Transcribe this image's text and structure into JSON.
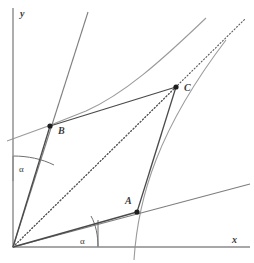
{
  "figure": {
    "background_color": "#ffffff",
    "width": 254,
    "height": 263
  },
  "axes": {
    "origin": {
      "x": 13,
      "y": 247,
      "label": "O"
    },
    "x_axis": {
      "label": "x",
      "label_x": 232,
      "label_y": 243,
      "from_x": 13,
      "from_y": 247,
      "to_x": 250,
      "to_y": 247,
      "color": "#8a8a8a"
    },
    "y_axis": {
      "label": "y",
      "label_x": 20,
      "label_y": 16,
      "from_x": 13,
      "from_y": 247,
      "to_x": 13,
      "to_y": 8,
      "color": "#8a8a8a"
    }
  },
  "points": [
    {
      "name": "A",
      "label": "A",
      "x": 137,
      "y": 212,
      "label_x": 125,
      "label_y": 204,
      "dot_radius": 2.6,
      "color": "#1e1e1e"
    },
    {
      "name": "B",
      "label": "B",
      "x": 50,
      "y": 126,
      "label_x": 58,
      "label_y": 133,
      "dot_radius": 2.6,
      "color": "#1e1e1e"
    },
    {
      "name": "C",
      "label": "C",
      "x": 176,
      "y": 87,
      "label_x": 184,
      "label_y": 91,
      "dot_radius": 2.6,
      "color": "#1e1e1e"
    }
  ],
  "segments": [
    {
      "name": "segment-origin-to-B",
      "from_x": 13,
      "from_y": 247,
      "to_x": 50,
      "to_y": 126,
      "color": "#4a4a4a",
      "style": "solid"
    },
    {
      "name": "segment-B-to-C",
      "from_x": 50,
      "from_y": 126,
      "to_x": 176,
      "to_y": 87,
      "color": "#4a4a4a",
      "style": "solid"
    },
    {
      "name": "segment-C-to-A",
      "from_x": 176,
      "from_y": 87,
      "to_x": 137,
      "to_y": 212,
      "color": "#4a4a4a",
      "style": "solid"
    },
    {
      "name": "segment-A-to-origin",
      "from_x": 137,
      "from_y": 212,
      "to_x": 13,
      "to_y": 247,
      "color": "#4a4a4a",
      "style": "solid"
    },
    {
      "name": "diagonal-origin-to-C",
      "from_x": 13,
      "from_y": 247,
      "to_x": 176,
      "to_y": 87,
      "color": "#5a5a5a",
      "style": "dotted"
    }
  ],
  "rays": [
    {
      "name": "ray-through-B",
      "from_x": 13,
      "from_y": 247,
      "to_x": 88,
      "to_y": 12,
      "color": "#7e7e7e"
    },
    {
      "name": "ray-diagonal-extended",
      "from_x": 13,
      "from_y": 247,
      "to_x": 246,
      "to_y": 18,
      "color": "#7e7e7e",
      "style": "dotted"
    },
    {
      "name": "ray-through-A",
      "from_x": 13,
      "from_y": 247,
      "to_x": 250,
      "to_y": 184,
      "color": "#7e7e7e"
    }
  ],
  "curves": [
    {
      "name": "hyperbola-branch-upper-left",
      "description": "curve passing through B, asymptotic toward upper right",
      "path": "M 7,141 C 30,133 52,125 86,111 C 124,94 160,62 206,18",
      "color": "#9b9b9b"
    },
    {
      "name": "hyperbola-branch-lower-right",
      "description": "curve passing through A and C, steep near x-axis",
      "path": "M 134,260 C 136,228 142,196 156,160 C 170,124 194,82 226,40",
      "color": "#9b9b9b"
    }
  ],
  "angles": [
    {
      "name": "angle-alpha-upper",
      "label": "α",
      "label_x": 19,
      "label_y": 172,
      "vertex_x": 13,
      "vertex_y": 247,
      "arc_path": "M 13,156 C 28,156 42,159 54,165",
      "leg_path": "M 13,156 L 13,181",
      "color": "#6f6f6f"
    },
    {
      "name": "angle-alpha-lower",
      "label": "α",
      "label_x": 80,
      "label_y": 244,
      "vertex_x": 13,
      "vertex_y": 247,
      "arc_path": "M 91,216 C 96,225 98,236 98,247",
      "leg_path": "M 98,220 L 98,247",
      "color": "#6f6f6f"
    }
  ],
  "legend": {
    "point_labels": [
      "A",
      "B",
      "C"
    ],
    "axis_labels": [
      "x",
      "y"
    ],
    "angle_labels": [
      "α",
      "α"
    ]
  }
}
